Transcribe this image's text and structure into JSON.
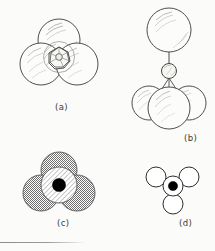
{
  "figure": {
    "background_color": "#fbfbf9",
    "ink_color": "#4a4a4a",
    "panel_count": 4,
    "panels": [
      {
        "id": "a",
        "caption": "(a)",
        "view": "space-filling model, top view",
        "description": "Three large outlined spheres in triangular arrangement with a small faceted central sphere visible between them",
        "sphere_count": 4,
        "large_sphere_count": 3,
        "small_sphere_count": 1,
        "shading": "outline with curved highlight hatching",
        "caption_x": 55,
        "caption_y": 106
      },
      {
        "id": "b",
        "caption": "(b)",
        "view": "side view with bond to apex sphere",
        "description": "One large sphere at top connected by a vertical bond line to a small central sphere, which connects by three short bond lines to a cluster of three large spheres below",
        "sphere_count": 5,
        "large_sphere_count": 4,
        "small_sphere_count": 1,
        "bond_count": 4,
        "shading": "outline with curved highlight hatching",
        "caption_x": 184,
        "caption_y": 137
      },
      {
        "id": "c",
        "caption": "(c)",
        "view": "overlapping orbital cross-section, top view",
        "description": "Three gray stippled circles in triangular arrangement overlapping a diagonally hatched central circle with a solid black dot at the centre",
        "circle_count": 4,
        "outer_circle_fill": "#a8a8a8",
        "center_circle_fill": "#ffffff",
        "center_circle_pattern": "diagonal hatch",
        "nucleus_fill": "#000000",
        "caption_x": 57,
        "caption_y": 222
      },
      {
        "id": "d",
        "caption": "(d)",
        "view": "skeletal / ball-and-stick schematic, top view",
        "description": "Three small white outlined circles arranged around a central outlined circle containing a solid black dot",
        "circle_count": 4,
        "outer_circle_fill": "#ffffff",
        "nucleus_fill": "#000000",
        "caption_x": 179,
        "caption_y": 222
      }
    ]
  }
}
